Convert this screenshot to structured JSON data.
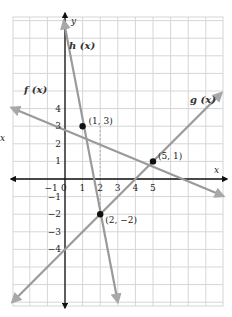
{
  "chart_data": {
    "type": "line",
    "title": "",
    "xlabel": "x",
    "ylabel": "y",
    "xlim": [
      -3,
      9
    ],
    "ylim": [
      -7,
      9
    ],
    "grid": true,
    "x_ticks": [
      "-1",
      "0",
      "1",
      "2",
      "3",
      "4",
      "5"
    ],
    "y_ticks": [
      "4",
      "3",
      "2",
      "1",
      "-1",
      "-2",
      "-3",
      "-4"
    ],
    "series": [
      {
        "name": "f (x)",
        "points": [
          [
            -3,
            3.67
          ],
          [
            1,
            3
          ],
          [
            5,
            1
          ],
          [
            9,
            -0.33
          ]
        ],
        "color": "#9a9a9a"
      },
      {
        "name": "g (x)",
        "points": [
          [
            -3,
            -7
          ],
          [
            2,
            -2
          ],
          [
            5,
            1
          ],
          [
            9,
            5
          ]
        ],
        "color": "#9a9a9a"
      },
      {
        "name": "h (x)",
        "points": [
          [
            0,
            8
          ],
          [
            1,
            3
          ],
          [
            2,
            -2
          ],
          [
            3,
            -7
          ]
        ],
        "color": "#9a9a9a"
      }
    ],
    "annotations": [
      {
        "label": "(1, 3)",
        "x": 1,
        "y": 3
      },
      {
        "label": "(5, 1)",
        "x": 5,
        "y": 1
      },
      {
        "label": "(2, −2)",
        "x": 2,
        "y": -2
      }
    ],
    "side_label": "x"
  }
}
